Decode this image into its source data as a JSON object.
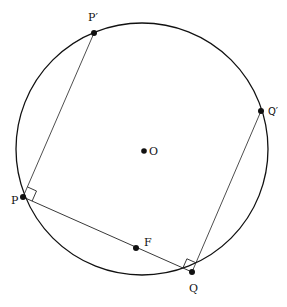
{
  "diagram": {
    "type": "geometry",
    "circle": {
      "center_label": "O",
      "cx": 142,
      "cy": 149,
      "r": 126
    },
    "points": [
      {
        "id": "P_prime",
        "label": "P′",
        "x": 94,
        "y": 33
      },
      {
        "id": "Q_prime",
        "label": "Q′",
        "x": 261,
        "y": 111
      },
      {
        "id": "O",
        "label": "O",
        "x": 144,
        "y": 151
      },
      {
        "id": "P",
        "label": "P",
        "x": 23,
        "y": 197
      },
      {
        "id": "F",
        "label": "F",
        "x": 136,
        "y": 248
      },
      {
        "id": "Q",
        "label": "Q",
        "x": 192,
        "y": 272
      }
    ],
    "segments": [
      {
        "from": "P",
        "to": "P_prime"
      },
      {
        "from": "P",
        "to": "Q"
      },
      {
        "from": "Q",
        "to": "Q_prime"
      }
    ],
    "right_angle_marks": [
      "P",
      "Q"
    ]
  }
}
